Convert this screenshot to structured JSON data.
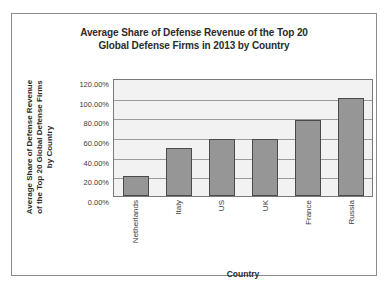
{
  "chart_data": {
    "type": "bar",
    "title": "Average Share of Defense Revenue of the Top 20 Global Defense Firms in 2013 by Country",
    "title_lines": [
      "Average Share of Defense Revenue of the Top 20",
      "Global Defense Firms in 2013 by Country"
    ],
    "xlabel": "Country",
    "ylabel": "Average Share of Defense Revenue of the Top 20 Global Defense Firms by Country",
    "ylabel_lines": [
      "Average Share of Defense Revenue",
      "of the Top 20 Global Defense Firms",
      "by Country"
    ],
    "categories": [
      "Netherlands",
      "Italy",
      "US",
      "UK",
      "France",
      "Russia"
    ],
    "values": [
      0.2,
      0.49,
      0.58,
      0.58,
      0.77,
      1.0
    ],
    "value_labels": [
      "20.00%",
      "49.00%",
      "58.00%",
      "58.00%",
      "77.00%",
      "100.00%"
    ],
    "ylim": [
      0,
      1.2
    ],
    "ytick_values": [
      1.2,
      1.0,
      0.8,
      0.6,
      0.4,
      0.2,
      0
    ],
    "ytick_labels": [
      "120.00%",
      "100.00%",
      "80.00%",
      "60.00%",
      "40.00%",
      "20.00%",
      "0.00%"
    ],
    "grid": true,
    "legend": false,
    "legend_position": "none",
    "colors": {
      "bar_fill": "#969696",
      "bar_border": "#4a4a4a",
      "plot_background": "#f2f2f2",
      "gridline": "#9a9a9a",
      "frame_border": "#8c8c8c",
      "text": "#2b2b2b"
    }
  }
}
